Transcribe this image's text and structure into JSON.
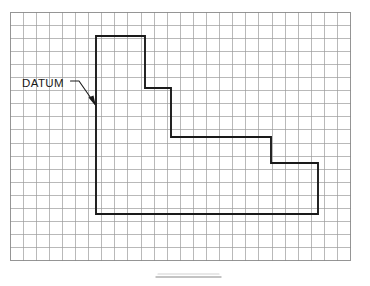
{
  "figure": {
    "background_color": "#ffffff"
  },
  "grid": {
    "origin_x": 10,
    "origin_y": 12,
    "cell_size": 13.1,
    "columns": 26,
    "rows": 19,
    "line_color": "#9b9b9b",
    "border_color": "#8a8a8a",
    "fill_color": "#ffffff"
  },
  "part": {
    "name": "stepped-l-profile",
    "stroke_color": "#1a1a1a",
    "stroke_width": 1.9,
    "points": "96,36 145,36 145,88 171,88 171,137 271,137 271,163 318,163 318,214 96,214 96,36",
    "vertices": [
      {
        "x": 96,
        "y": 36,
        "label": "top-left-datum-corner"
      },
      {
        "x": 145,
        "y": 36,
        "label": "top-right"
      },
      {
        "x": 145,
        "y": 88,
        "label": "step-1-down"
      },
      {
        "x": 171,
        "y": 88,
        "label": "step-1-right"
      },
      {
        "x": 171,
        "y": 137,
        "label": "step-2-down"
      },
      {
        "x": 271,
        "y": 137,
        "label": "step-2-right"
      },
      {
        "x": 271,
        "y": 163,
        "label": "step-3-down"
      },
      {
        "x": 318,
        "y": 163,
        "label": "step-3-right"
      },
      {
        "x": 318,
        "y": 214,
        "label": "bottom-right"
      },
      {
        "x": 96,
        "y": 214,
        "label": "bottom-left"
      }
    ]
  },
  "annotation": {
    "datum_label": "DATUM",
    "label_x": 22,
    "label_y": 87,
    "leader_path": "M 70.5 81 L 79 81 L 95 104",
    "arrow_tip_x": 96,
    "arrow_tip_y": 106,
    "arrow_points": "96,106.5 88.5,97.5 93.5,95.5",
    "color": "#1a1a1a"
  },
  "caption": {
    "bar_x1": 156,
    "bar_x2": 221,
    "bar_y": 277,
    "soft_bar_y": 274,
    "color": "#b0b0b0"
  }
}
